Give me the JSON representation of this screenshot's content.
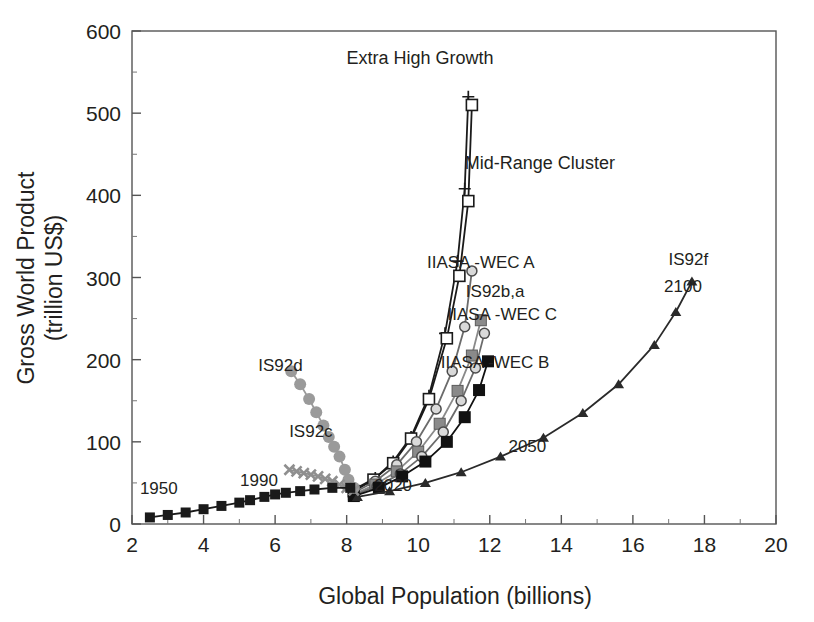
{
  "chart_data": {
    "type": "line",
    "title": "",
    "xlabel": "Global Population (billions)",
    "ylabel": "Gross World Product (trillion US$)",
    "xlim": [
      2,
      20
    ],
    "ylim": [
      0,
      600
    ],
    "xticks": [
      2,
      4,
      6,
      8,
      10,
      12,
      14,
      16,
      18,
      20
    ],
    "yticks": [
      0,
      100,
      200,
      300,
      400,
      500,
      600
    ],
    "minor_ticks": true,
    "grid": false,
    "legend": "none (inline curve labels)",
    "annotations": [
      {
        "text": "Extra High Growth",
        "x": 10.05,
        "y": 560
      },
      {
        "text": "Mid-Range Cluster",
        "x": 13.4,
        "y": 432
      },
      {
        "text": "IIASA -WEC A",
        "x": 11.75,
        "y": 312
      },
      {
        "text": "IS92b,a",
        "x": 12.15,
        "y": 276
      },
      {
        "text": "IIASA -WEC C",
        "x": 12.35,
        "y": 248
      },
      {
        "text": "IIASA -WEC B",
        "x": 12.15,
        "y": 190
      },
      {
        "text": "IS92f",
        "x": 17.55,
        "y": 315
      },
      {
        "text": "2100",
        "x": 17.4,
        "y": 282
      },
      {
        "text": "2050",
        "x": 13.05,
        "y": 88
      },
      {
        "text": "IS92d",
        "x": 6.15,
        "y": 186
      },
      {
        "text": "IS92c",
        "x": 7.0,
        "y": 106
      },
      {
        "text": "1990",
        "x": 5.55,
        "y": 46
      },
      {
        "text": "1950",
        "x": 2.75,
        "y": 36
      },
      {
        "text": "2020",
        "x": 9.3,
        "y": 40
      }
    ],
    "series": [
      {
        "name": "Extra High Growth (plus)",
        "marker": "plus",
        "color": "#1a1a1a",
        "points": [
          [
            8.2,
            42
          ],
          [
            8.8,
            56
          ],
          [
            9.3,
            76
          ],
          [
            9.8,
            106
          ],
          [
            10.3,
            156
          ],
          [
            10.75,
            232
          ],
          [
            11.1,
            320
          ],
          [
            11.3,
            408
          ],
          [
            11.4,
            520
          ]
        ]
      },
      {
        "name": "Extra High Growth (open square)",
        "marker": "open-square",
        "color": "#1a1a1a",
        "points": [
          [
            8.2,
            40
          ],
          [
            8.75,
            54
          ],
          [
            9.3,
            74
          ],
          [
            9.8,
            104
          ],
          [
            10.3,
            152
          ],
          [
            10.8,
            226
          ],
          [
            11.15,
            302
          ],
          [
            11.4,
            393
          ],
          [
            11.5,
            510
          ]
        ]
      },
      {
        "name": "IIASA -WEC A",
        "marker": "open-circle-gray",
        "color": "#6b6b6b",
        "points": [
          [
            8.2,
            38
          ],
          [
            8.8,
            52
          ],
          [
            9.4,
            72
          ],
          [
            9.95,
            100
          ],
          [
            10.5,
            140
          ],
          [
            10.95,
            186
          ],
          [
            11.3,
            240
          ],
          [
            11.5,
            308
          ]
        ]
      },
      {
        "name": "IS92b,a",
        "marker": "gray-square",
        "color": "#8a8a8a",
        "points": [
          [
            8.2,
            36
          ],
          [
            8.8,
            48
          ],
          [
            9.4,
            64
          ],
          [
            10.0,
            88
          ],
          [
            10.6,
            122
          ],
          [
            11.1,
            162
          ],
          [
            11.5,
            205
          ],
          [
            11.75,
            248
          ]
        ]
      },
      {
        "name": "IIASA -WEC C",
        "marker": "open-circle-gray",
        "color": "#6b6b6b",
        "points": [
          [
            8.2,
            35
          ],
          [
            8.85,
            46
          ],
          [
            9.5,
            61
          ],
          [
            10.1,
            82
          ],
          [
            10.7,
            112
          ],
          [
            11.2,
            150
          ],
          [
            11.6,
            190
          ],
          [
            11.85,
            232
          ]
        ]
      },
      {
        "name": "IIASA -WEC B",
        "marker": "filled-square",
        "color": "#111111",
        "points": [
          [
            8.2,
            34
          ],
          [
            8.9,
            44
          ],
          [
            9.55,
            58
          ],
          [
            10.2,
            76
          ],
          [
            10.8,
            100
          ],
          [
            11.3,
            130
          ],
          [
            11.7,
            163
          ],
          [
            11.95,
            198
          ]
        ]
      },
      {
        "name": "IS92f",
        "marker": "filled-triangle",
        "color": "#2a2a2a",
        "points": [
          [
            8.3,
            33
          ],
          [
            9.2,
            40
          ],
          [
            10.2,
            50
          ],
          [
            11.2,
            63
          ],
          [
            12.3,
            82
          ],
          [
            13.5,
            105
          ],
          [
            14.6,
            135
          ],
          [
            15.6,
            170
          ],
          [
            16.6,
            218
          ],
          [
            17.2,
            258
          ],
          [
            17.65,
            295
          ]
        ]
      },
      {
        "name": "IS92d",
        "marker": "gray-circle",
        "color": "#9a9a9a",
        "points": [
          [
            6.45,
            186
          ],
          [
            6.7,
            170
          ],
          [
            6.95,
            152
          ],
          [
            7.15,
            136
          ],
          [
            7.35,
            120
          ],
          [
            7.5,
            106
          ],
          [
            7.65,
            94
          ],
          [
            7.8,
            82
          ],
          [
            7.95,
            66
          ],
          [
            8.05,
            54
          ],
          [
            8.2,
            44
          ]
        ]
      },
      {
        "name": "IS92c",
        "marker": "gray-x",
        "color": "#8f8f8f",
        "points": [
          [
            6.4,
            66
          ],
          [
            6.6,
            64
          ],
          [
            6.8,
            62
          ],
          [
            7.0,
            60
          ],
          [
            7.2,
            58
          ],
          [
            7.4,
            55
          ],
          [
            7.6,
            52
          ],
          [
            7.8,
            48
          ],
          [
            8.0,
            44
          ],
          [
            8.2,
            41
          ]
        ]
      },
      {
        "name": "Historical 1950-1990",
        "marker": "filled-square-small",
        "color": "#1a1a1a",
        "points": [
          [
            2.5,
            8
          ],
          [
            3.0,
            11
          ],
          [
            3.5,
            14
          ],
          [
            4.0,
            18
          ],
          [
            4.5,
            22
          ],
          [
            5.0,
            26
          ],
          [
            5.3,
            29
          ],
          [
            5.7,
            33
          ],
          [
            6.0,
            36
          ],
          [
            6.3,
            38
          ],
          [
            6.7,
            40
          ],
          [
            7.1,
            42
          ],
          [
            7.6,
            44
          ],
          [
            8.1,
            44
          ]
        ]
      }
    ]
  },
  "axis": {
    "ylabel_line1": "Gross World Product",
    "ylabel_line2": "(trillion US$)",
    "xlabel": "Global Population (billions)",
    "y_tick_labels": [
      "600",
      "500",
      "400",
      "300",
      "200",
      "100",
      "0"
    ],
    "x_tick_labels": [
      "2",
      "4",
      "6",
      "8",
      "10",
      "12",
      "14",
      "16",
      "18",
      "20"
    ]
  },
  "labels": {
    "extra_high_growth": "Extra High Growth",
    "mid_range_cluster": "Mid-Range Cluster",
    "iiasa_wec_a": "IIASA -WEC A",
    "is92ba": "IS92b,a",
    "iiasa_wec_c": "IIASA -WEC C",
    "iiasa_wec_b": "IIASA -WEC B",
    "is92f": "IS92f",
    "y2100": "2100",
    "y2050": "2050",
    "is92d": "IS92d",
    "is92c": "IS92c",
    "y1990": "1990",
    "y1950": "1950",
    "y2020": "2020"
  },
  "colors": {
    "axis": "#555555",
    "text": "#231f20",
    "dark_series": "#1a1a1a",
    "mid_gray": "#6b6b6b",
    "light_gray": "#9a9a9a"
  }
}
